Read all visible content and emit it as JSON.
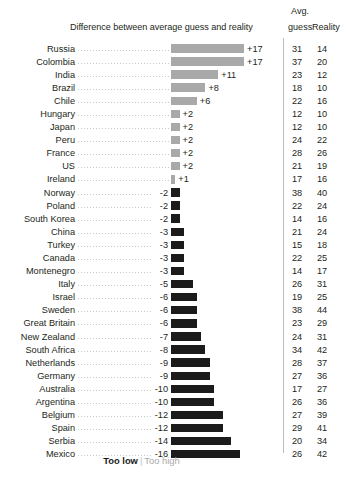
{
  "header": {
    "diff_title": "Difference between average guess and reality",
    "avg_line1": "Avg.",
    "avg_line2": "guess",
    "reality": "Reality"
  },
  "legend": {
    "too_low": "Too low",
    "separator": "|",
    "too_high": "Too high"
  },
  "colors": {
    "positive_bar": "#a9a9a9",
    "negative_bar": "#1b1b1b",
    "text": "#231f20",
    "leader": "#c9c9c9",
    "divider": "#bcbcbc"
  },
  "chart_data": {
    "type": "bar",
    "title": "Difference between average guess and reality",
    "subtype": "diverging-horizontal",
    "xlabel": "",
    "ylabel": "",
    "xlim": [
      -16,
      17
    ],
    "grid": false,
    "legend_position": "bottom",
    "legend": [
      "Too low",
      "Too high"
    ],
    "columns": [
      "Country",
      "Difference",
      "Avg. guess",
      "Reality"
    ],
    "categories": [
      "Russia",
      "Colombia",
      "India",
      "Brazil",
      "Chile",
      "Hungary",
      "Japan",
      "Peru",
      "France",
      "US",
      "Ireland",
      "Norway",
      "Poland",
      "South Korea",
      "China",
      "Turkey",
      "Canada",
      "Montenegro",
      "Italy",
      "Israel",
      "Sweden",
      "Great Britain",
      "New Zealand",
      "South Africa",
      "Netherlands",
      "Germany",
      "Australia",
      "Argentina",
      "Belgium",
      "Spain",
      "Serbia",
      "Mexico"
    ],
    "series": [
      {
        "name": "Difference",
        "values": [
          17,
          17,
          11,
          8,
          6,
          2,
          2,
          2,
          2,
          2,
          1,
          -2,
          -2,
          -2,
          -3,
          -3,
          -3,
          -3,
          -5,
          -6,
          -6,
          -6,
          -7,
          -8,
          -9,
          -9,
          -10,
          -10,
          -12,
          -12,
          -14,
          -16
        ]
      },
      {
        "name": "Avg. guess",
        "values": [
          31,
          37,
          23,
          18,
          22,
          12,
          12,
          24,
          28,
          21,
          17,
          38,
          22,
          14,
          21,
          15,
          22,
          14,
          26,
          19,
          38,
          23,
          24,
          34,
          28,
          27,
          17,
          26,
          27,
          29,
          20,
          26
        ]
      },
      {
        "name": "Reality",
        "values": [
          14,
          20,
          12,
          10,
          16,
          10,
          10,
          22,
          26,
          19,
          16,
          40,
          24,
          16,
          24,
          18,
          25,
          17,
          31,
          25,
          44,
          29,
          31,
          42,
          37,
          36,
          27,
          36,
          39,
          41,
          34,
          42
        ]
      }
    ],
    "rows": [
      {
        "country": "Russia",
        "diff": 17,
        "diff_label": "+17",
        "guess": 31,
        "reality": 14
      },
      {
        "country": "Colombia",
        "diff": 17,
        "diff_label": "+17",
        "guess": 37,
        "reality": 20
      },
      {
        "country": "India",
        "diff": 11,
        "diff_label": "+11",
        "guess": 23,
        "reality": 12
      },
      {
        "country": "Brazil",
        "diff": 8,
        "diff_label": "+8",
        "guess": 18,
        "reality": 10
      },
      {
        "country": "Chile",
        "diff": 6,
        "diff_label": "+6",
        "guess": 22,
        "reality": 16
      },
      {
        "country": "Hungary",
        "diff": 2,
        "diff_label": "+2",
        "guess": 12,
        "reality": 10
      },
      {
        "country": "Japan",
        "diff": 2,
        "diff_label": "+2",
        "guess": 12,
        "reality": 10
      },
      {
        "country": "Peru",
        "diff": 2,
        "diff_label": "+2",
        "guess": 24,
        "reality": 22
      },
      {
        "country": "France",
        "diff": 2,
        "diff_label": "+2",
        "guess": 28,
        "reality": 26
      },
      {
        "country": "US",
        "diff": 2,
        "diff_label": "+2",
        "guess": 21,
        "reality": 19
      },
      {
        "country": "Ireland",
        "diff": 1,
        "diff_label": "+1",
        "guess": 17,
        "reality": 16
      },
      {
        "country": "Norway",
        "diff": -2,
        "diff_label": "-2",
        "guess": 38,
        "reality": 40
      },
      {
        "country": "Poland",
        "diff": -2,
        "diff_label": "-2",
        "guess": 22,
        "reality": 24
      },
      {
        "country": "South Korea",
        "diff": -2,
        "diff_label": "-2",
        "guess": 14,
        "reality": 16
      },
      {
        "country": "China",
        "diff": -3,
        "diff_label": "-3",
        "guess": 21,
        "reality": 24
      },
      {
        "country": "Turkey",
        "diff": -3,
        "diff_label": "-3",
        "guess": 15,
        "reality": 18
      },
      {
        "country": "Canada",
        "diff": -3,
        "diff_label": "-3",
        "guess": 22,
        "reality": 25
      },
      {
        "country": "Montenegro",
        "diff": -3,
        "diff_label": "-3",
        "guess": 14,
        "reality": 17
      },
      {
        "country": "Italy",
        "diff": -5,
        "diff_label": "-5",
        "guess": 26,
        "reality": 31
      },
      {
        "country": "Israel",
        "diff": -6,
        "diff_label": "-6",
        "guess": 19,
        "reality": 25
      },
      {
        "country": "Sweden",
        "diff": -6,
        "diff_label": "-6",
        "guess": 38,
        "reality": 44
      },
      {
        "country": "Great Britain",
        "diff": -6,
        "diff_label": "-6",
        "guess": 23,
        "reality": 29
      },
      {
        "country": "New Zealand",
        "diff": -7,
        "diff_label": "-7",
        "guess": 24,
        "reality": 31
      },
      {
        "country": "South Africa",
        "diff": -8,
        "diff_label": "-8",
        "guess": 34,
        "reality": 42
      },
      {
        "country": "Netherlands",
        "diff": -9,
        "diff_label": "-9",
        "guess": 28,
        "reality": 37
      },
      {
        "country": "Germany",
        "diff": -9,
        "diff_label": "-9",
        "guess": 27,
        "reality": 36
      },
      {
        "country": "Australia",
        "diff": -10,
        "diff_label": "-10",
        "guess": 17,
        "reality": 27
      },
      {
        "country": "Argentina",
        "diff": -10,
        "diff_label": "-10",
        "guess": 26,
        "reality": 36
      },
      {
        "country": "Belgium",
        "diff": -12,
        "diff_label": "-12",
        "guess": 27,
        "reality": 39
      },
      {
        "country": "Spain",
        "diff": -12,
        "diff_label": "-12",
        "guess": 29,
        "reality": 41
      },
      {
        "country": "Serbia",
        "diff": -14,
        "diff_label": "-14",
        "guess": 20,
        "reality": 34
      },
      {
        "country": "Mexico",
        "diff": -16,
        "diff_label": "-16",
        "guess": 26,
        "reality": 42
      }
    ]
  }
}
